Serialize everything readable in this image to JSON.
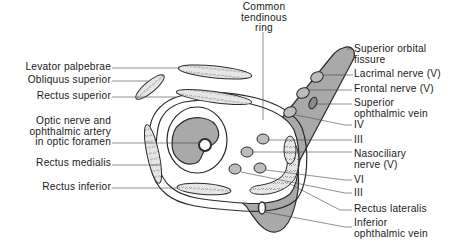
{
  "colors": {
    "fissure_fill": "#a9a9a9",
    "muscle_fill": "#e6e6e6",
    "nerve_fill": "#bdbdbd",
    "outline": "#2b2b2b",
    "background": "#ffffff"
  },
  "labels": {
    "top": {
      "common_tendinous_ring": [
        "Common",
        "tendinous",
        "ring"
      ]
    },
    "left": [
      {
        "id": "levator-palpebrae",
        "lines": [
          "Levator palpebrae"
        ]
      },
      {
        "id": "obliquus-superior",
        "lines": [
          "Obliquus superior"
        ]
      },
      {
        "id": "rectus-superior",
        "lines": [
          "Rectus superior"
        ]
      },
      {
        "id": "optic-nerve",
        "lines": [
          "Optic nerve and",
          "ophthalmic artery",
          "in optic foramen"
        ]
      },
      {
        "id": "rectus-medialis",
        "lines": [
          "Rectus medialis"
        ]
      },
      {
        "id": "rectus-inferior",
        "lines": [
          "Rectus inferior"
        ]
      }
    ],
    "right": [
      {
        "id": "superior-orbital-fissure",
        "lines": [
          "Superior orbital",
          "fissure"
        ]
      },
      {
        "id": "lacrimal-nerve",
        "lines": [
          "Lacrimal nerve (V)"
        ]
      },
      {
        "id": "frontal-nerve",
        "lines": [
          "Frontal nerve (V)"
        ]
      },
      {
        "id": "superior-ophthalmic-vein",
        "lines": [
          "Superior",
          "ophthalmic vein"
        ]
      },
      {
        "id": "nerve-iv",
        "lines": [
          "IV"
        ]
      },
      {
        "id": "nerve-iii-upper",
        "lines": [
          "III"
        ]
      },
      {
        "id": "nasociliary-nerve",
        "lines": [
          "Nasociliary",
          "nerve (V)"
        ]
      },
      {
        "id": "nerve-vi",
        "lines": [
          "VI"
        ]
      },
      {
        "id": "nerve-iii-lower",
        "lines": [
          "III"
        ]
      },
      {
        "id": "rectus-lateralis",
        "lines": [
          "Rectus lateralis"
        ]
      },
      {
        "id": "inferior-ophthalmic-vein",
        "lines": [
          "Inferior",
          "ophthalmic vein"
        ]
      }
    ]
  }
}
